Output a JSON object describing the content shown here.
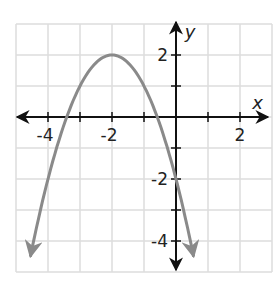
{
  "chart_data": {
    "type": "line",
    "title": "",
    "xlabel": "x",
    "ylabel": "y",
    "xlim": [
      -5,
      3
    ],
    "ylim": [
      -5,
      3
    ],
    "grid": true,
    "x_tick_labels": [
      {
        "value": -4,
        "label": "-4"
      },
      {
        "value": -2,
        "label": "-2"
      },
      {
        "value": 2,
        "label": "2"
      }
    ],
    "y_tick_labels": [
      {
        "value": 2,
        "label": "2"
      },
      {
        "value": -2,
        "label": "-2"
      },
      {
        "value": -4,
        "label": "-4"
      }
    ],
    "series": [
      {
        "name": "parabola",
        "equation": "y = -(x + 2)^2 + 2",
        "vertex": [
          -2,
          2
        ],
        "y_intercept": [
          0,
          -2
        ],
        "x": [
          -4.55,
          -4.0,
          -3.5,
          -3.0,
          -2.5,
          -2.0,
          -1.5,
          -1.0,
          -0.5,
          0.0,
          0.55
        ],
        "y": [
          -4.5,
          -2.0,
          -0.25,
          1.0,
          1.75,
          2.0,
          1.75,
          1.0,
          -0.25,
          -2.0,
          -4.5
        ],
        "color": "#8a8a8a",
        "arrows_both_ends": true
      }
    ]
  },
  "colors": {
    "grid": "#dcdcdc",
    "axis": "#111111",
    "curve": "#8a8a8a"
  }
}
